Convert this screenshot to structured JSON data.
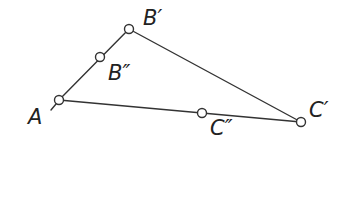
{
  "diagram": {
    "type": "triangle-construction",
    "stroke_color": "#333333",
    "background": "#ffffff",
    "points": [
      {
        "id": "A",
        "label": "A",
        "x": 59,
        "y": 100
      },
      {
        "id": "B1",
        "label": "B′",
        "x": 129,
        "y": 29
      },
      {
        "id": "B2",
        "label": "B″",
        "x": 100,
        "y": 57
      },
      {
        "id": "C1",
        "label": "C′",
        "x": 301,
        "y": 122
      },
      {
        "id": "C2",
        "label": "C″",
        "x": 202,
        "y": 113
      }
    ],
    "segments": [
      {
        "from": "A",
        "to": "B1"
      },
      {
        "from": "B1",
        "to": "C1"
      },
      {
        "from": "A",
        "to": "C1"
      }
    ],
    "labels": {
      "A": "A",
      "B1": "B′",
      "B2": "B″",
      "C1": "C′",
      "C2": "C″"
    }
  }
}
